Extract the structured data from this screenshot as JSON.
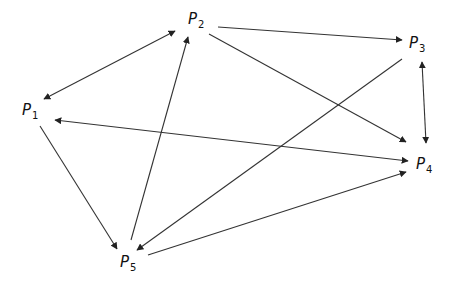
{
  "diagram": {
    "type": "directed-graph",
    "line_color": "#333333",
    "nodes": [
      {
        "id": "P1",
        "base": "P",
        "sub": "1",
        "x": 22,
        "y": 103
      },
      {
        "id": "P2",
        "base": "P",
        "sub": "2",
        "x": 188,
        "y": 12
      },
      {
        "id": "P3",
        "base": "P",
        "sub": "3",
        "x": 409,
        "y": 36
      },
      {
        "id": "P4",
        "base": "P",
        "sub": "4",
        "x": 416,
        "y": 157
      },
      {
        "id": "P5",
        "base": "P",
        "sub": "5",
        "x": 120,
        "y": 255
      }
    ],
    "edges": [
      {
        "from": "P1",
        "to": "P2",
        "bidirectional": true
      },
      {
        "from": "P2",
        "to": "P3",
        "bidirectional": false
      },
      {
        "from": "P2",
        "to": "P4",
        "bidirectional": false
      },
      {
        "from": "P3",
        "to": "P4",
        "bidirectional": true
      },
      {
        "from": "P4",
        "to": "P1",
        "bidirectional": true
      },
      {
        "from": "P1",
        "to": "P5",
        "bidirectional": false
      },
      {
        "from": "P5",
        "to": "P2",
        "bidirectional": false
      },
      {
        "from": "P3",
        "to": "P5",
        "bidirectional": false
      },
      {
        "from": "P5",
        "to": "P4",
        "bidirectional": false
      }
    ]
  }
}
